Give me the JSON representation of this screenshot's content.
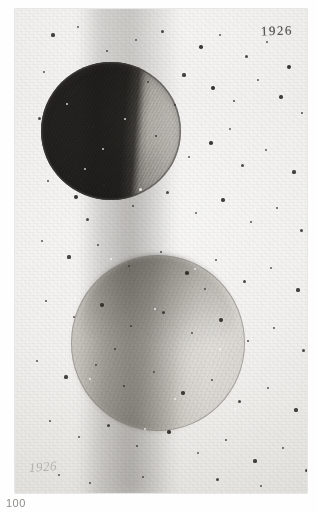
{
  "plate": {
    "caption_number": "100",
    "date_inscription": "1926",
    "signature_inscription": "1926",
    "alt_title": "Two spheres in phase, graphite drawing"
  },
  "figures": [
    {
      "name": "upper-sphere",
      "description": "Dark graphite sphere, shaded left two-thirds, illuminated right limb",
      "terminator": "vertical, right of centre"
    },
    {
      "name": "lower-sphere",
      "description": "Pale sphere, soft gradient shading, faint outline",
      "terminator": "vertical, near centre"
    }
  ],
  "colors": {
    "paper": "#f2f1ef",
    "graphite_dark": "#2e2c2a",
    "graphite_mid": "#a8a6a1",
    "graphite_light": "#e0ded9",
    "ink": "#35332f",
    "caption": "#8e8c88"
  },
  "specks_dark": [
    [
      38,
      26,
      1.6
    ],
    [
      63,
      18,
      1.2
    ],
    [
      92,
      42,
      1.4
    ],
    [
      121,
      31,
      1.1
    ],
    [
      147,
      22,
      1.5
    ],
    [
      186,
      38,
      1.8
    ],
    [
      205,
      26,
      1.2
    ],
    [
      231,
      47,
      1.5
    ],
    [
      252,
      33,
      1.3
    ],
    [
      274,
      58,
      1.9
    ],
    [
      29,
      63,
      1.3
    ],
    [
      58,
      84,
      1.1
    ],
    [
      104,
      57,
      1.4
    ],
    [
      133,
      73,
      1.2
    ],
    [
      169,
      66,
      1.6
    ],
    [
      198,
      79,
      2.1
    ],
    [
      219,
      92,
      1.4
    ],
    [
      243,
      71,
      1.2
    ],
    [
      266,
      88,
      1.7
    ],
    [
      287,
      104,
      1.4
    ],
    [
      24,
      109,
      1.5
    ],
    [
      47,
      131,
      1.2
    ],
    [
      78,
      118,
      1.3
    ],
    [
      112,
      142,
      1.1
    ],
    [
      141,
      127,
      1.4
    ],
    [
      174,
      148,
      1.2
    ],
    [
      196,
      134,
      1.8
    ],
    [
      227,
      156,
      1.5
    ],
    [
      251,
      141,
      1.2
    ],
    [
      279,
      163,
      1.6
    ],
    [
      33,
      172,
      1.4
    ],
    [
      61,
      188,
      1.9
    ],
    [
      89,
      176,
      1.2
    ],
    [
      118,
      197,
      1.3
    ],
    [
      152,
      183,
      1.5
    ],
    [
      181,
      204,
      1.2
    ],
    [
      208,
      191,
      1.7
    ],
    [
      236,
      213,
      1.4
    ],
    [
      262,
      199,
      1.3
    ],
    [
      286,
      221,
      1.5
    ],
    [
      27,
      232,
      1.2
    ],
    [
      54,
      248,
      1.6
    ],
    [
      83,
      236,
      1.3
    ],
    [
      114,
      257,
      1.1
    ],
    [
      146,
      243,
      1.4
    ],
    [
      172,
      264,
      1.8
    ],
    [
      201,
      251,
      1.3
    ],
    [
      229,
      272,
      1.5
    ],
    [
      256,
      259,
      1.2
    ],
    [
      283,
      281,
      1.6
    ],
    [
      31,
      292,
      1.4
    ],
    [
      59,
      308,
      1.2
    ],
    [
      87,
      296,
      1.7
    ],
    [
      116,
      317,
      1.3
    ],
    [
      148,
      303,
      1.5
    ],
    [
      177,
      324,
      1.2
    ],
    [
      206,
      311,
      1.9
    ],
    [
      233,
      332,
      1.4
    ],
    [
      259,
      319,
      1.3
    ],
    [
      288,
      341,
      1.5
    ],
    [
      22,
      352,
      1.3
    ],
    [
      51,
      368,
      1.6
    ],
    [
      81,
      356,
      1.2
    ],
    [
      109,
      377,
      1.4
    ],
    [
      139,
      363,
      1.1
    ],
    [
      168,
      384,
      1.7
    ],
    [
      197,
      371,
      1.3
    ],
    [
      224,
      392,
      1.5
    ],
    [
      253,
      379,
      1.2
    ],
    [
      281,
      401,
      1.6
    ],
    [
      35,
      412,
      1.4
    ],
    [
      64,
      428,
      1.2
    ],
    [
      93,
      416,
      1.5
    ],
    [
      122,
      437,
      1.3
    ],
    [
      154,
      423,
      1.8
    ],
    [
      183,
      444,
      1.2
    ],
    [
      211,
      431,
      1.4
    ],
    [
      240,
      452,
      1.6
    ],
    [
      268,
      439,
      1.3
    ],
    [
      291,
      461,
      1.5
    ],
    [
      44,
      466,
      1.2
    ],
    [
      75,
      474,
      1.4
    ],
    [
      128,
      468,
      1.3
    ],
    [
      202,
      470,
      1.5
    ],
    [
      246,
      477,
      1.2
    ],
    [
      160,
      96,
      1.3
    ],
    [
      72,
      210,
      1.5
    ],
    [
      190,
      280,
      1.2
    ],
    [
      100,
      340,
      1.4
    ],
    [
      215,
      120,
      1.1
    ]
  ],
  "specks_light": [
    [
      52,
      95,
      1.4
    ],
    [
      88,
      140,
      1.2
    ],
    [
      125,
      180,
      1.5
    ],
    [
      70,
      160,
      1.1
    ],
    [
      110,
      110,
      1.3
    ],
    [
      96,
      250,
      1.2
    ],
    [
      140,
      300,
      1.4
    ],
    [
      180,
      260,
      1.1
    ],
    [
      205,
      340,
      1.3
    ],
    [
      160,
      390,
      1.2
    ],
    [
      240,
      200,
      1.2
    ],
    [
      60,
      290,
      1.3
    ],
    [
      130,
      420,
      1.1
    ],
    [
      220,
      400,
      1.4
    ],
    [
      75,
      370,
      1.2
    ]
  ]
}
